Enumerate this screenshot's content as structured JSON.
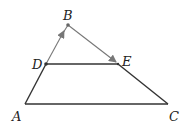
{
  "diagram": {
    "type": "geometry-triangle",
    "points": {
      "A": {
        "label": "A",
        "x": 25,
        "y": 104
      },
      "B": {
        "label": "B",
        "x": 68,
        "y": 25
      },
      "C": {
        "label": "C",
        "x": 168,
        "y": 104
      },
      "D": {
        "label": "D",
        "x": 46,
        "y": 64
      },
      "E": {
        "label": "E",
        "x": 118,
        "y": 64
      }
    },
    "segments": [
      {
        "from": "A",
        "to": "D",
        "style": "dark"
      },
      {
        "from": "D",
        "to": "B",
        "style": "gray",
        "arrow": "toward B"
      },
      {
        "from": "B",
        "to": "E",
        "style": "gray",
        "arrow": "toward E"
      },
      {
        "from": "E",
        "to": "C",
        "style": "dark"
      },
      {
        "from": "A",
        "to": "C",
        "style": "dark"
      },
      {
        "from": "D",
        "to": "E",
        "style": "dark"
      }
    ],
    "colors": {
      "dark": "#333333",
      "gray": "#777777"
    }
  }
}
